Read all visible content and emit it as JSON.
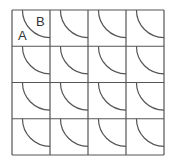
{
  "diagram": {
    "type": "tiled-grid",
    "rows": 4,
    "columns": 4,
    "tile_motif": "quarter-circle arc centered at top-right corner of each square",
    "labels": [
      {
        "text": "A",
        "region": "outside arc, top-left tile"
      },
      {
        "text": "B",
        "region": "inside arc, top-left tile"
      }
    ],
    "stroke_color": "#555555",
    "background_color": "#ffffff"
  }
}
